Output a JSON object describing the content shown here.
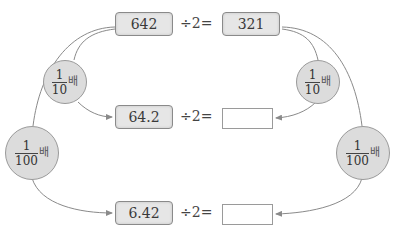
{
  "top_row": {
    "value": "642",
    "operator": "÷2=",
    "result": "321"
  },
  "middle_row": {
    "value": "64.2",
    "operator": "÷2=",
    "result": ""
  },
  "bottom_row": {
    "value": "6.42",
    "operator": "÷2=",
    "result": ""
  },
  "multipliers": {
    "left_tenth": {
      "numerator": "1",
      "denominator": "10",
      "unit": "배"
    },
    "left_hundredth": {
      "numerator": "1",
      "denominator": "100",
      "unit": "배"
    },
    "right_tenth": {
      "numerator": "1",
      "denominator": "10",
      "unit": "배"
    },
    "right_hundredth": {
      "numerator": "1",
      "denominator": "100",
      "unit": "배"
    }
  },
  "colors": {
    "box_fill": "#e6e6e6",
    "circle_fill": "#dcdcdc",
    "line": "#8a8a8a"
  }
}
